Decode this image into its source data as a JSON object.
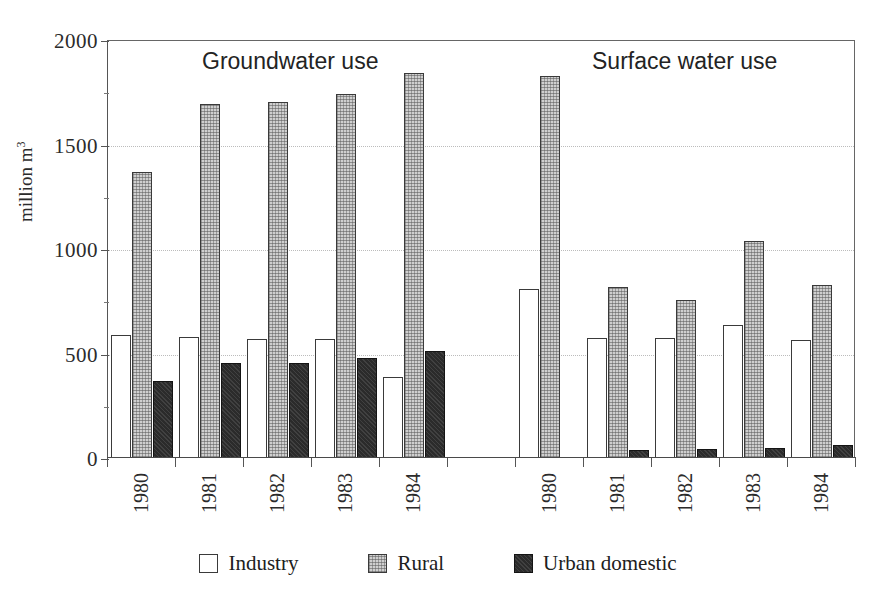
{
  "chart_data": {
    "type": "bar",
    "title": "",
    "xlabel": "",
    "ylabel": "million m",
    "ylabel_sup": "3",
    "ylim": [
      0,
      2000
    ],
    "yticks": [
      0,
      500,
      1000,
      1500,
      2000
    ],
    "ytick_labels": [
      "0",
      "500",
      "1000",
      "1500",
      "2000"
    ],
    "grid": true,
    "legend_position": "bottom",
    "sections": [
      {
        "name": "Groundwater use",
        "categories": [
          "1980",
          "1981",
          "1982",
          "1983",
          "1984"
        ],
        "series": [
          {
            "name": "Industry",
            "values": [
              590,
              580,
              570,
              570,
              390
            ]
          },
          {
            "name": "Rural",
            "values": [
              1370,
              1695,
              1705,
              1740,
              1840
            ]
          },
          {
            "name": "Urban domestic",
            "values": [
              370,
              455,
              455,
              480,
              510
            ]
          }
        ]
      },
      {
        "name": "Surface water use",
        "categories": [
          "1980",
          "1981",
          "1982",
          "1983",
          "1984"
        ],
        "series": [
          {
            "name": "Industry",
            "values": [
              810,
              575,
              575,
              635,
              565
            ]
          },
          {
            "name": "Rural",
            "values": [
              1830,
              820,
              755,
              1040,
              830
            ]
          },
          {
            "name": "Urban domestic",
            "values": [
              0,
              40,
              45,
              50,
              60
            ]
          }
        ]
      }
    ],
    "legend": [
      {
        "label": "Industry",
        "swatch": "open-white-square",
        "color": "#ffffff"
      },
      {
        "label": "Rural",
        "swatch": "stippled-gray-square",
        "color": "#cfcfcf"
      },
      {
        "label": "Urban domestic",
        "swatch": "filled-dark-square",
        "color": "#2b2b2b"
      }
    ]
  },
  "axis": {
    "y_title_text": "million m",
    "y_title_sup": "3"
  },
  "sections": {
    "groundwater_label": "Groundwater use",
    "surface_label": "Surface water use"
  }
}
